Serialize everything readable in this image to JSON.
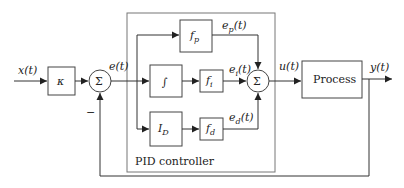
{
  "diagram": {
    "type": "block-diagram",
    "signals": {
      "input": "x(t)",
      "error": "e(t)",
      "proportional": {
        "base": "e",
        "sub": "p",
        "arg": "(t)"
      },
      "integral": {
        "base": "e",
        "sub": "i",
        "arg": "(t)"
      },
      "derivative": {
        "base": "e",
        "sub": "d",
        "arg": "(t)"
      },
      "control": "u(t)",
      "output": "y(t)"
    },
    "blocks": {
      "gain": "κ",
      "sum1": "Σ",
      "fp": {
        "base": "f",
        "sub": "p"
      },
      "integrator": "∫",
      "fi": {
        "base": "f",
        "sub": "i"
      },
      "derivative_op": {
        "base": "I",
        "sub": "D"
      },
      "fd": {
        "base": "f",
        "sub": "d"
      },
      "sum2": "Σ",
      "process": "Process"
    },
    "controller_label": "PID controller",
    "feedback_sign": "−",
    "colors": {
      "line": "#333333",
      "frame": "#777777",
      "background": "#ffffff"
    }
  }
}
